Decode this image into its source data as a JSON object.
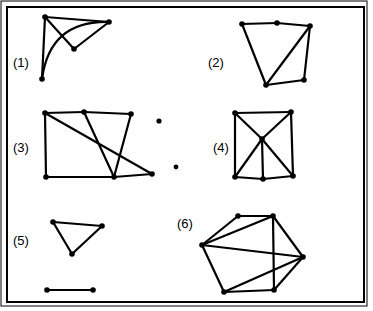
{
  "figure": {
    "background_color": "#ffffff",
    "ink_color": "#000000",
    "frame": {
      "outer": {
        "x": 1,
        "y": 1,
        "width": 366,
        "height": 305,
        "stroke_width": 1
      },
      "inner": {
        "x": 7,
        "y": 7,
        "width": 357,
        "height": 295,
        "stroke_width": 2
      }
    },
    "node_radius": 2.8,
    "edge_width": 2.2
  },
  "labels": [
    {
      "id": "label-1",
      "text": "(1)",
      "x": 13,
      "y": 67
    },
    {
      "id": "label-2",
      "text": "(2)",
      "x": 208,
      "y": 67
    },
    {
      "id": "label-3",
      "text": "(3)",
      "x": 13,
      "y": 152
    },
    {
      "id": "label-4",
      "text": "(4)",
      "x": 213,
      "y": 152
    },
    {
      "id": "label-5",
      "text": "(5)",
      "x": 13,
      "y": 245
    },
    {
      "id": "label-6",
      "text": "(6)",
      "x": 177,
      "y": 228
    }
  ],
  "graphs": [
    {
      "id": "graph-1",
      "label": "(1)",
      "node_count": 4,
      "edge_count": 5,
      "nodes": [
        {
          "id": "g1-a",
          "x": 45,
          "y": 17
        },
        {
          "id": "g1-b",
          "x": 109,
          "y": 22
        },
        {
          "id": "g1-c",
          "x": 74,
          "y": 49
        },
        {
          "id": "g1-d",
          "x": 42,
          "y": 79
        }
      ],
      "edges": [
        {
          "from": "g1-a",
          "to": "g1-b",
          "type": "line"
        },
        {
          "from": "g1-a",
          "to": "g1-c",
          "type": "line"
        },
        {
          "from": "g1-b",
          "to": "g1-c",
          "type": "line"
        },
        {
          "from": "g1-a",
          "to": "g1-d",
          "type": "line"
        },
        {
          "from": "g1-b",
          "to": "g1-d",
          "type": "arc",
          "curve": "bulge-right-down"
        }
      ]
    },
    {
      "id": "graph-2",
      "label": "(2)",
      "node_count": 5,
      "edge_count": 6,
      "nodes": [
        {
          "id": "g2-a",
          "x": 242,
          "y": 24
        },
        {
          "id": "g2-b",
          "x": 277,
          "y": 23
        },
        {
          "id": "g2-c",
          "x": 310,
          "y": 26
        },
        {
          "id": "g2-d",
          "x": 266,
          "y": 85
        },
        {
          "id": "g2-e",
          "x": 304,
          "y": 80
        }
      ],
      "edges": [
        {
          "from": "g2-a",
          "to": "g2-b",
          "type": "line"
        },
        {
          "from": "g2-b",
          "to": "g2-c",
          "type": "line"
        },
        {
          "from": "g2-a",
          "to": "g2-d",
          "type": "line"
        },
        {
          "from": "g2-c",
          "to": "g2-d",
          "type": "line"
        },
        {
          "from": "g2-c",
          "to": "g2-e",
          "type": "line"
        },
        {
          "from": "g2-d",
          "to": "g2-e",
          "type": "line"
        }
      ]
    },
    {
      "id": "graph-3",
      "label": "(3)",
      "node_count": 6,
      "edge_count": 8,
      "nodes": [
        {
          "id": "g3-a",
          "x": 45,
          "y": 113
        },
        {
          "id": "g3-b",
          "x": 84,
          "y": 112
        },
        {
          "id": "g3-c",
          "x": 131,
          "y": 114
        },
        {
          "id": "g3-d",
          "x": 46,
          "y": 177
        },
        {
          "id": "g3-e",
          "x": 114,
          "y": 177
        },
        {
          "id": "g3-f",
          "x": 152,
          "y": 174
        }
      ],
      "edges": [
        {
          "from": "g3-a",
          "to": "g3-b",
          "type": "line"
        },
        {
          "from": "g3-b",
          "to": "g3-c",
          "type": "line"
        },
        {
          "from": "g3-a",
          "to": "g3-d",
          "type": "line"
        },
        {
          "from": "g3-a",
          "to": "g3-f",
          "type": "line"
        },
        {
          "from": "g3-b",
          "to": "g3-e",
          "type": "line"
        },
        {
          "from": "g3-c",
          "to": "g3-e",
          "type": "line"
        },
        {
          "from": "g3-d",
          "to": "g3-e",
          "type": "line"
        },
        {
          "from": "g3-e",
          "to": "g3-f",
          "type": "line"
        }
      ]
    },
    {
      "id": "graph-4",
      "label": "(4)",
      "node_count": 6,
      "edge_count": 10,
      "nodes": [
        {
          "id": "g4-a",
          "x": 235,
          "y": 113
        },
        {
          "id": "g4-b",
          "x": 291,
          "y": 112
        },
        {
          "id": "g4-c",
          "x": 262,
          "y": 139
        },
        {
          "id": "g4-d",
          "x": 235,
          "y": 177
        },
        {
          "id": "g4-e",
          "x": 263,
          "y": 179
        },
        {
          "id": "g4-f",
          "x": 293,
          "y": 176
        }
      ],
      "edges": [
        {
          "from": "g4-a",
          "to": "g4-b",
          "type": "line"
        },
        {
          "from": "g4-a",
          "to": "g4-d",
          "type": "line"
        },
        {
          "from": "g4-b",
          "to": "g4-f",
          "type": "line"
        },
        {
          "from": "g4-a",
          "to": "g4-c",
          "type": "line"
        },
        {
          "from": "g4-b",
          "to": "g4-c",
          "type": "line"
        },
        {
          "from": "g4-c",
          "to": "g4-d",
          "type": "line"
        },
        {
          "from": "g4-c",
          "to": "g4-e",
          "type": "line"
        },
        {
          "from": "g4-c",
          "to": "g4-f",
          "type": "line"
        },
        {
          "from": "g4-d",
          "to": "g4-e",
          "type": "line"
        },
        {
          "from": "g4-e",
          "to": "g4-f",
          "type": "line"
        }
      ]
    },
    {
      "id": "graph-5",
      "label": "(5)",
      "node_count": 5,
      "edge_count": 4,
      "nodes": [
        {
          "id": "g5-a",
          "x": 53,
          "y": 222
        },
        {
          "id": "g5-b",
          "x": 102,
          "y": 226
        },
        {
          "id": "g5-c",
          "x": 72,
          "y": 254
        },
        {
          "id": "g5-d",
          "x": 47,
          "y": 290
        },
        {
          "id": "g5-e",
          "x": 93,
          "y": 290
        }
      ],
      "edges": [
        {
          "from": "g5-a",
          "to": "g5-b",
          "type": "line"
        },
        {
          "from": "g5-a",
          "to": "g5-c",
          "type": "line"
        },
        {
          "from": "g5-b",
          "to": "g5-c",
          "type": "line"
        },
        {
          "from": "g5-d",
          "to": "g5-e",
          "type": "line"
        }
      ]
    },
    {
      "id": "graph-6",
      "label": "(6)",
      "node_count": 6,
      "edge_count": 10,
      "nodes": [
        {
          "id": "g6-a",
          "x": 238,
          "y": 216
        },
        {
          "id": "g6-b",
          "x": 273,
          "y": 216
        },
        {
          "id": "g6-c",
          "x": 202,
          "y": 245
        },
        {
          "id": "g6-d",
          "x": 303,
          "y": 257
        },
        {
          "id": "g6-e",
          "x": 224,
          "y": 292
        },
        {
          "id": "g6-f",
          "x": 274,
          "y": 290
        }
      ],
      "edges": [
        {
          "from": "g6-a",
          "to": "g6-b",
          "type": "line"
        },
        {
          "from": "g6-a",
          "to": "g6-c",
          "type": "line"
        },
        {
          "from": "g6-b",
          "to": "g6-c",
          "type": "line"
        },
        {
          "from": "g6-b",
          "to": "g6-d",
          "type": "line"
        },
        {
          "from": "g6-b",
          "to": "g6-f",
          "type": "line"
        },
        {
          "from": "g6-c",
          "to": "g6-d",
          "type": "line"
        },
        {
          "from": "g6-c",
          "to": "g6-e",
          "type": "line"
        },
        {
          "from": "g6-d",
          "to": "g6-e",
          "type": "line"
        },
        {
          "from": "g6-d",
          "to": "g6-f",
          "type": "line"
        },
        {
          "from": "g6-e",
          "to": "g6-f",
          "type": "line"
        }
      ]
    }
  ],
  "stray_marks": [
    {
      "id": "stray-dot-1",
      "x": 159,
      "y": 121,
      "r": 2.6
    },
    {
      "id": "stray-dot-2",
      "x": 176,
      "y": 167,
      "r": 2.4
    }
  ]
}
